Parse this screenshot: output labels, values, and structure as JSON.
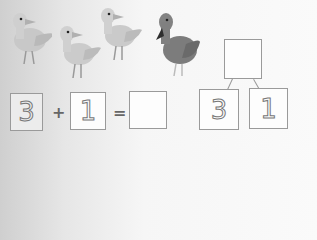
{
  "worksheet": {
    "ducks": [
      {
        "kind": "light-duck",
        "color": "#c9c9c9"
      },
      {
        "kind": "light-duck",
        "color": "#cdcdcd"
      },
      {
        "kind": "light-duck",
        "color": "#cbcbcb"
      },
      {
        "kind": "dark-duck",
        "color": "#7a7a7a"
      }
    ],
    "equation": {
      "addend1": "3",
      "plus": "+",
      "addend2": "1",
      "equals": "=",
      "sum": ""
    },
    "number_bond": {
      "whole": "",
      "part1": "3",
      "part2": "1"
    }
  }
}
